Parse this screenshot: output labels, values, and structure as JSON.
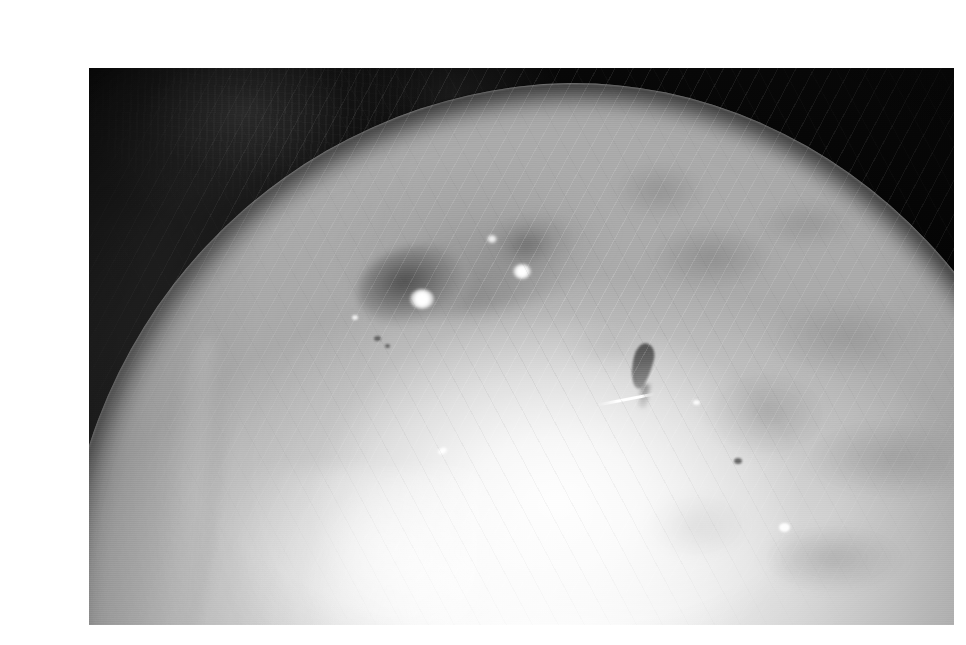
{
  "page": {
    "background_color": "#ffffff",
    "width": 966,
    "height": 645
  },
  "photograph": {
    "name": "underwater-grayscale-photo",
    "alt_text": "Grayscale underwater photograph of the broad pale head of a large marine animal rising against black water",
    "frame": {
      "left": 49,
      "top": 52,
      "width": 865,
      "height": 557
    },
    "palette": {
      "background_black": "#000000",
      "deep_shadow": "#0a0a0a",
      "mid_gray": "#9c9c9c",
      "body_light": "#dcdcdc",
      "highlight_white": "#ffffff",
      "page_white": "#ffffff"
    },
    "subject": {
      "label": "animal-head",
      "description": "Large pale dome-shaped head filling the lower two thirds of the frame, silhouetted against black water in the upper corners"
    },
    "features": [
      {
        "name": "eye-left-marking",
        "description": "Dark oval depression with bright specular glint",
        "approx_center": [
          370,
          270
        ]
      },
      {
        "name": "eye-right-marking",
        "description": "Softer dark oval with small bright glint",
        "approx_center": [
          485,
          255
        ]
      },
      {
        "name": "dark-mark",
        "description": "Small dark elongated blotch on the flank",
        "approx_center": [
          602,
          345
        ]
      },
      {
        "name": "white-streak",
        "description": "Thin bright diagonal streak below the dark mark",
        "approx_center": [
          585,
          383
        ]
      },
      {
        "name": "mottled-flank",
        "description": "Cloudy dark blotches across the right shoulder"
      },
      {
        "name": "rim-light",
        "description": "Faint bright rim along the lower-left silhouette"
      },
      {
        "name": "blown-highlight",
        "description": "Overexposed white area in the lower centre"
      }
    ],
    "texture_notes": "Soft analogue video grain with faint horizontal scan lines across the whole frame"
  }
}
